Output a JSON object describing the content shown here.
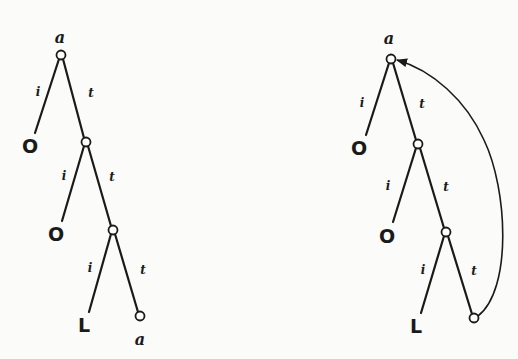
{
  "figure": {
    "stroke_color": "#1a1a1a",
    "background_color": "#fbfbf9"
  },
  "left_tree": {
    "root_label": "a",
    "level1": {
      "i_edge_label": "i",
      "t_edge_label": "t",
      "i_leaf": "O"
    },
    "level2": {
      "i_edge_label": "i",
      "t_edge_label": "t",
      "i_leaf": "O"
    },
    "level3": {
      "i_edge_label": "i",
      "t_edge_label": "t",
      "i_leaf": "L",
      "t_leaf_label": "a"
    }
  },
  "right_tree": {
    "root_label": "a",
    "level1": {
      "i_edge_label": "i",
      "t_edge_label": "t",
      "i_leaf": "O"
    },
    "level2": {
      "i_edge_label": "i",
      "t_edge_label": "t",
      "i_leaf": "O"
    },
    "level3": {
      "i_edge_label": "i",
      "t_edge_label": "t",
      "i_leaf": "L"
    },
    "back_edge": {
      "from": "last t-leaf",
      "to": "root",
      "arrow": "arrowhead at root"
    }
  }
}
